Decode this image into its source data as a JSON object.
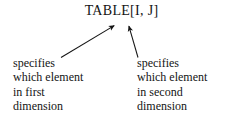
{
  "figure": {
    "background_color": "#ffffff",
    "ink_color": "#141414",
    "expression": "TABLE[I, J]",
    "annotations": [
      {
        "id": "first-dimension",
        "lines": [
          "specifies",
          "which element",
          "in first",
          "dimension"
        ],
        "arrow": {
          "label": "arrow-to-first-index",
          "tail_x": 61,
          "tail_y": 57,
          "tip_x": 116,
          "tip_y": 24,
          "points_to": "I"
        }
      },
      {
        "id": "second-dimension",
        "lines": [
          "specifies",
          "which element",
          "in second",
          "dimension"
        ],
        "arrow": {
          "label": "arrow-to-second-index",
          "tail_x": 138,
          "tail_y": 57,
          "tip_x": 128,
          "tip_y": 24,
          "points_to": "J"
        }
      }
    ]
  }
}
